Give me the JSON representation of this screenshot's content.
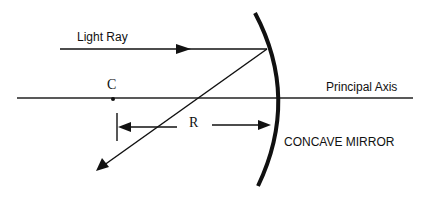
{
  "diagram": {
    "type": "ray-optics",
    "labels": {
      "light_ray": "Light Ray",
      "center": "C",
      "principal_axis": "Principal Axis",
      "radius": "R",
      "mirror": "CONCAVE MIRROR"
    },
    "colors": {
      "background": "#ffffff",
      "stroke": "#111111"
    }
  }
}
